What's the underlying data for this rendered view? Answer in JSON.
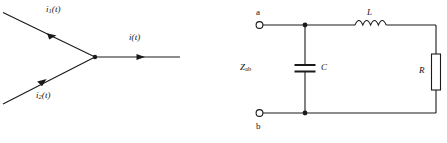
{
  "figure": {
    "stroke_color": "#1a1a1a",
    "background_color": "#ffffff"
  },
  "left_diagram": {
    "name": "current-junction-diagram",
    "labels": {
      "i1": {
        "symbol": "i",
        "subscript": "1",
        "arg": "(t)",
        "text": "i₁(t)"
      },
      "i2": {
        "symbol": "i",
        "subscript": "2",
        "arg": "(t)",
        "text": "i₂(t)"
      },
      "i_out": {
        "symbol": "i",
        "subscript": "",
        "arg": "(t)",
        "text": "i(t)"
      }
    },
    "branches": [
      {
        "name": "incoming-branch-1",
        "label_ref": "i1",
        "direction": "down-right",
        "arrow": "toward-node"
      },
      {
        "name": "incoming-branch-2",
        "label_ref": "i2",
        "direction": "up-right",
        "arrow": "toward-node"
      },
      {
        "name": "outgoing-branch",
        "label_ref": "i_out",
        "direction": "right",
        "arrow": "away-from-node"
      }
    ],
    "node": {
      "name": "junction-node",
      "type": "filled-dot"
    }
  },
  "right_diagram": {
    "name": "rlc-circuit-diagram",
    "terminals": [
      {
        "name": "terminal-a",
        "label": "a",
        "position": "top-left",
        "marker": "open-circle"
      },
      {
        "name": "terminal-b",
        "label": "b",
        "position": "bottom-left",
        "marker": "open-circle"
      }
    ],
    "impedance_label": {
      "symbol": "Z",
      "subscript": "ab",
      "text": "Zab"
    },
    "components": [
      {
        "name": "capacitor-c",
        "type": "capacitor",
        "label": "C",
        "orientation": "vertical",
        "position": "shunt-branch"
      },
      {
        "name": "inductor-l",
        "type": "inductor",
        "label": "L",
        "orientation": "horizontal",
        "position": "top-series",
        "coils": 4
      },
      {
        "name": "resistor-r",
        "type": "resistor",
        "label": "R",
        "orientation": "vertical",
        "position": "right-branch"
      }
    ],
    "nodes": [
      {
        "name": "top-node",
        "type": "filled-dot"
      },
      {
        "name": "bottom-node",
        "type": "filled-dot"
      }
    ]
  }
}
